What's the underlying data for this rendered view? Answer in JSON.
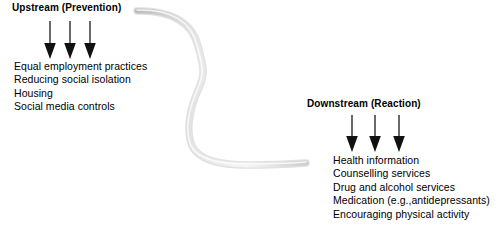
{
  "diagram": {
    "background_color": "#ffffff",
    "text_color": "#000000",
    "river": {
      "name": "stream-curve",
      "stroke_color": "#d5d5d5",
      "shadow_color": "#b0b0b0",
      "highlight_color": "#f2f2f2",
      "stroke_width": 5
    },
    "arrow_color": "#1a1a1a"
  },
  "upstream": {
    "heading": "Upstream (Prevention)",
    "arrows": [
      {
        "name": "upstream-arrow-1"
      },
      {
        "name": "upstream-arrow-2"
      },
      {
        "name": "upstream-arrow-3"
      }
    ],
    "items": [
      "Equal employment practices",
      "Reducing social isolation",
      "Housing",
      "Social media controls"
    ]
  },
  "downstream": {
    "heading": "Downstream (Reaction)",
    "arrows": [
      {
        "name": "downstream-arrow-1"
      },
      {
        "name": "downstream-arrow-2"
      },
      {
        "name": "downstream-arrow-3"
      }
    ],
    "items": [
      "Health information",
      "Counselling services",
      "Drug and alcohol services",
      "Medication (e.g.,antidepressants)",
      "Encouraging physical activity"
    ]
  }
}
